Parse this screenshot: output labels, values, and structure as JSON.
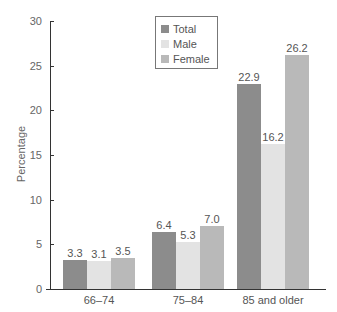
{
  "chart_data": {
    "type": "bar",
    "title": "",
    "xlabel": "",
    "ylabel": "Percentage",
    "ylim": [
      0,
      30
    ],
    "yticks": [
      0,
      5,
      10,
      15,
      20,
      25,
      30
    ],
    "grid": false,
    "legend_position": "top-center",
    "categories": [
      "66–74",
      "75–84",
      "85 and older"
    ],
    "series": [
      {
        "name": "Total",
        "color": "#8c8c8c",
        "values": [
          3.3,
          6.4,
          22.9
        ]
      },
      {
        "name": "Male",
        "color": "#e3e3e3",
        "values": [
          3.1,
          5.3,
          16.2
        ]
      },
      {
        "name": "Female",
        "color": "#b9b9b9",
        "values": [
          3.5,
          7.0,
          26.2
        ]
      }
    ],
    "data_labels": [
      [
        "3.3",
        "3.1",
        "3.5"
      ],
      [
        "6.4",
        "5.3",
        "7.0"
      ],
      [
        "22.9",
        "16.2",
        "26.2"
      ]
    ]
  },
  "axis": {
    "y_title": "Percentage",
    "y_ticks": [
      "0",
      "5",
      "10",
      "15",
      "20",
      "25",
      "30"
    ]
  },
  "legend": {
    "items": [
      {
        "label": "Total",
        "color": "#8c8c8c"
      },
      {
        "label": "Male",
        "color": "#e3e3e3"
      },
      {
        "label": "Female",
        "color": "#b9b9b9"
      }
    ]
  }
}
